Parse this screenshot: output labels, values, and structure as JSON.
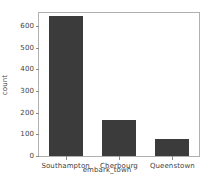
{
  "chart_data": {
    "type": "bar",
    "title": "",
    "categories": [
      "Southampton",
      "Cherbourg",
      "Queenstown"
    ],
    "values": [
      644,
      168,
      77
    ],
    "series": [
      {
        "name": "count",
        "values": [
          644,
          168,
          77
        ]
      }
    ],
    "xlabel": "embark_town",
    "ylabel": "count",
    "ylim": [
      0,
      660
    ],
    "xlim": [
      -0.5,
      2.5
    ],
    "yticks": [
      0,
      100,
      200,
      300,
      400,
      500,
      600
    ],
    "ytick_labels": [
      "0",
      "100",
      "200",
      "300",
      "400",
      "500",
      "600"
    ],
    "xtick_labels": [
      "Southampton",
      "Cherbourg",
      "Queenstown"
    ],
    "grid": false,
    "legend": false,
    "legend_position": "none",
    "bar_color": "#3b3b3b",
    "axes_edge_color": "#b0b0b0",
    "background_color": "#ffffff",
    "tick_color": "#8a8a8a",
    "text_color": "#3f3f3f"
  }
}
